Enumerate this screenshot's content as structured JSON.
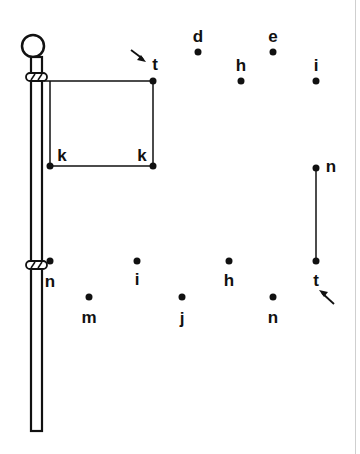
{
  "puzzle": {
    "colors": {
      "ink": "#111111",
      "paper": "#ffffff"
    },
    "dots": [
      {
        "id": "t-top",
        "letter": "t",
        "x": 153,
        "y": 81,
        "lx": 154,
        "ly": 63
      },
      {
        "id": "k-left",
        "letter": "k",
        "x": 50,
        "y": 166,
        "lx": 62,
        "ly": 155
      },
      {
        "id": "k-right",
        "letter": "k",
        "x": 153,
        "y": 166,
        "lx": 142,
        "ly": 155
      },
      {
        "id": "d",
        "letter": "d",
        "x": 198,
        "y": 52,
        "lx": 198,
        "ly": 36
      },
      {
        "id": "e",
        "letter": "e",
        "x": 273,
        "y": 52,
        "lx": 273,
        "ly": 36
      },
      {
        "id": "h-top",
        "letter": "h",
        "x": 241,
        "y": 81,
        "lx": 241,
        "ly": 66
      },
      {
        "id": "i-top",
        "letter": "i",
        "x": 316,
        "y": 81,
        "lx": 316,
        "ly": 66
      },
      {
        "id": "n-right",
        "letter": "n",
        "x": 316,
        "y": 168,
        "lx": 330,
        "ly": 167
      },
      {
        "id": "n-left",
        "letter": "n",
        "x": 50,
        "y": 261,
        "lx": 50,
        "ly": 281
      },
      {
        "id": "i-bottom",
        "letter": "i",
        "x": 137,
        "y": 261,
        "lx": 137,
        "ly": 279
      },
      {
        "id": "h-bottom",
        "letter": "h",
        "x": 229,
        "y": 261,
        "lx": 229,
        "ly": 281
      },
      {
        "id": "t-bottom",
        "letter": "t",
        "x": 316,
        "y": 261,
        "lx": 316,
        "ly": 281
      },
      {
        "id": "m",
        "letter": "m",
        "x": 89,
        "y": 297,
        "lx": 89,
        "ly": 317
      },
      {
        "id": "j",
        "letter": "j",
        "x": 182,
        "y": 297,
        "lx": 182,
        "ly": 319
      },
      {
        "id": "n-bottom",
        "letter": "n",
        "x": 273,
        "y": 297,
        "lx": 273,
        "ly": 317
      }
    ],
    "arrows": [
      {
        "id": "start-arrow-top",
        "direction": "down-right"
      },
      {
        "id": "start-arrow-bottom",
        "direction": "up-left"
      }
    ]
  }
}
